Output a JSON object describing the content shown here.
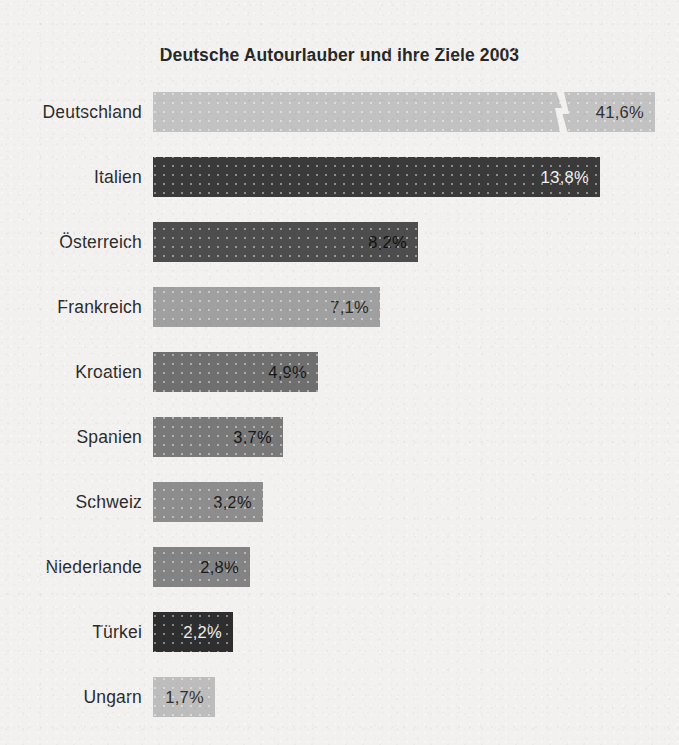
{
  "chart_data": {
    "type": "bar",
    "orientation": "horizontal",
    "title": "Deutsche Autourlauber und ihre Ziele 2003",
    "xlabel": "",
    "ylabel": "",
    "unit": "%",
    "grid": false,
    "legend": "none",
    "axis_break": {
      "present": true,
      "category": "Deutschland",
      "note": "zigzag break mark on the longest bar; bar lengths are not to scale"
    },
    "categories": [
      "Deutschland",
      "Italien",
      "Österreich",
      "Frankreich",
      "Kroatien",
      "Spanien",
      "Schweiz",
      "Niederlande",
      "Türkei",
      "Ungarn"
    ],
    "values": [
      41.6,
      13.8,
      8.2,
      7.1,
      4.9,
      3.7,
      3.2,
      2.8,
      2.2,
      1.7
    ],
    "value_labels": [
      "41,6%",
      "13,8%",
      "8,2%",
      "7,1%",
      "4,9%",
      "3,7%",
      "3,2%",
      "2,8%",
      "2,2%",
      "1,7%"
    ],
    "bars": [
      {
        "label": "Deutschland",
        "value": 41.6,
        "value_label": "41,6%",
        "px_width": 502,
        "top": 92,
        "color": "#c2c2c2",
        "text_color": "#303030",
        "broken": true,
        "break_x": 400
      },
      {
        "label": "Italien",
        "value": 13.8,
        "value_label": "13,8%",
        "px_width": 447,
        "top": 157,
        "color": "#3a3a3a",
        "text_color": "#f3f3f3",
        "broken": false
      },
      {
        "label": "Österreich",
        "value": 8.2,
        "value_label": "8,2%",
        "px_width": 265,
        "top": 222,
        "color": "#4d4d4d",
        "text_color": "#111111",
        "broken": false
      },
      {
        "label": "Frankreich",
        "value": 7.1,
        "value_label": "7,1%",
        "px_width": 227,
        "top": 287,
        "color": "#a0a0a0",
        "text_color": "#2b2b2b",
        "broken": false
      },
      {
        "label": "Kroatien",
        "value": 4.9,
        "value_label": "4,9%",
        "px_width": 165,
        "top": 352,
        "color": "#6f6f6f",
        "text_color": "#181818",
        "broken": false
      },
      {
        "label": "Spanien",
        "value": 3.7,
        "value_label": "3,7%",
        "px_width": 130,
        "top": 417,
        "color": "#797979",
        "text_color": "#161616",
        "broken": false
      },
      {
        "label": "Schweiz",
        "value": 3.2,
        "value_label": "3,2%",
        "px_width": 110,
        "top": 482,
        "color": "#8d8d8d",
        "text_color": "#1d1d1d",
        "broken": false
      },
      {
        "label": "Niederlande",
        "value": 2.8,
        "value_label": "2,8%",
        "px_width": 97,
        "top": 547,
        "color": "#838383",
        "text_color": "#1a1a1a",
        "broken": false
      },
      {
        "label": "Türkei",
        "value": 2.2,
        "value_label": "2,2%",
        "px_width": 80,
        "top": 612,
        "color": "#2e2e2e",
        "text_color": "#f0f0f0",
        "broken": false
      },
      {
        "label": "Ungarn",
        "value": 1.7,
        "value_label": "1,7%",
        "px_width": 62,
        "top": 677,
        "color": "#bdbdbd",
        "text_color": "#2e2e2e",
        "broken": false
      }
    ],
    "colors": {
      "background": "#f2f1ef",
      "title": "#272727",
      "label": "#2b2b2b"
    }
  }
}
